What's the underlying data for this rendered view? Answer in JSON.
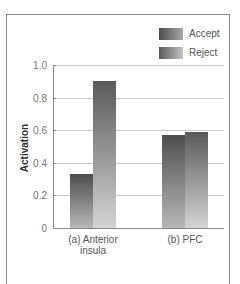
{
  "chart_data": {
    "type": "bar",
    "title": "",
    "xlabel": "",
    "ylabel": "Activation",
    "ylim": [
      0,
      1.0
    ],
    "yticks": [
      0,
      0.2,
      0.4,
      0.6,
      0.8,
      1.0
    ],
    "ytick_labels": [
      "0",
      "0.2",
      "0.4",
      "0.6",
      "0.8",
      "1.0"
    ],
    "grid": true,
    "legend_position": "top-right",
    "categories": [
      "(a) Anterior insula",
      "(b) PFC"
    ],
    "category_labels_display": [
      "(a) Anterior\ninsula",
      "(b) PFC"
    ],
    "series": [
      {
        "name": "Accept",
        "values": [
          0.33,
          0.57
        ],
        "gradient_top": "#4e4e4e",
        "gradient_bottom": "#b8b8b8"
      },
      {
        "name": "Reject",
        "values": [
          0.9,
          0.59
        ],
        "gradient_top": "#5a5a5a",
        "gradient_bottom": "#d4d4d4"
      }
    ]
  },
  "legend": {
    "items": [
      {
        "label": "Accept"
      },
      {
        "label": "Reject"
      }
    ]
  },
  "axis": {
    "y_title": "Activation"
  }
}
